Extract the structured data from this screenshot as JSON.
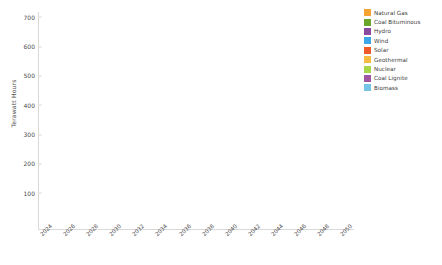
{
  "chart_data": {
    "type": "bar",
    "stacked": true,
    "title": "",
    "xlabel": "",
    "ylabel": "Terawatt Hours",
    "ylim": [
      0,
      740
    ],
    "yticks": [
      100,
      200,
      300,
      400,
      500,
      600,
      700
    ],
    "grid": false,
    "legend_position": "right",
    "categories": [
      "2024",
      "2025",
      "2026",
      "2027",
      "2028",
      "2029",
      "2030",
      "2031",
      "2032",
      "2033",
      "2034",
      "2035",
      "2036",
      "2037",
      "2038",
      "2039",
      "2040",
      "2041",
      "2042",
      "2043",
      "2044",
      "2045",
      "2046",
      "2047",
      "2048",
      "2049",
      "2050"
    ],
    "tick_labels": [
      "2024",
      "",
      "2026",
      "",
      "2028",
      "",
      "2030",
      "",
      "2032",
      "",
      "2034",
      "",
      "2036",
      "",
      "2038",
      "",
      "2040",
      "",
      "2042",
      "",
      "2044",
      "",
      "2046",
      "",
      "2048",
      "",
      "2050"
    ],
    "series": [
      {
        "name": "Biomass",
        "color": "#76c4e8",
        "values": [
          22,
          22,
          22,
          22,
          22,
          22,
          22,
          22,
          22,
          22,
          22,
          22,
          22,
          22,
          22,
          22,
          22,
          22,
          22,
          22,
          22,
          22,
          22,
          22,
          22,
          22,
          22
        ]
      },
      {
        "name": "Coal Lignite",
        "color": "#a055a0",
        "values": [
          38,
          38,
          38,
          38,
          38,
          38,
          38,
          38,
          38,
          38,
          38,
          38,
          38,
          38,
          38,
          38,
          38,
          38,
          38,
          38,
          38,
          38,
          38,
          38,
          38,
          38,
          38
        ]
      },
      {
        "name": "Nuclear",
        "color": "#a8d64a",
        "values": [
          4,
          4,
          4,
          4,
          4,
          4,
          4,
          4,
          4,
          4,
          4,
          4,
          4,
          4,
          4,
          4,
          4,
          4,
          4,
          4,
          4,
          4,
          4,
          4,
          4,
          4,
          4
        ]
      },
      {
        "name": "Geothermal",
        "color": "#f6bb43",
        "values": [
          4,
          4,
          4,
          4,
          4,
          4,
          4,
          4,
          4,
          4,
          4,
          4,
          4,
          4,
          4,
          4,
          4,
          4,
          4,
          4,
          4,
          4,
          4,
          4,
          4,
          4,
          4
        ]
      },
      {
        "name": "Solar",
        "color": "#ef5a2b",
        "values": [
          8,
          9,
          9,
          10,
          10,
          11,
          11,
          12,
          12,
          13,
          13,
          14,
          14,
          15,
          15,
          16,
          16,
          17,
          17,
          18,
          18,
          19,
          19,
          20,
          20,
          21,
          21
        ]
      },
      {
        "name": "Wind",
        "color": "#3ba7e8",
        "values": [
          32,
          36,
          40,
          44,
          48,
          52,
          56,
          60,
          64,
          68,
          72,
          76,
          80,
          84,
          88,
          92,
          96,
          100,
          104,
          108,
          112,
          116,
          118,
          120,
          122,
          124,
          126
        ]
      },
      {
        "name": "Hydro",
        "color": "#8a4b9e",
        "values": [
          190,
          195,
          200,
          205,
          210,
          215,
          220,
          226,
          232,
          238,
          244,
          250,
          256,
          262,
          268,
          274,
          280,
          286,
          290,
          294,
          296,
          298,
          300,
          300,
          300,
          300,
          300
        ]
      },
      {
        "name": "Coal Bituminous",
        "color": "#6aa62b",
        "values": [
          0,
          0,
          0,
          6,
          12,
          18,
          24,
          30,
          34,
          38,
          42,
          46,
          50,
          54,
          58,
          62,
          66,
          70,
          74,
          78,
          82,
          86,
          88,
          90,
          92,
          94,
          96
        ]
      },
      {
        "name": "Natural Gas",
        "color": "#f5a333",
        "values": [
          112,
          118,
          124,
          126,
          128,
          134,
          140,
          144,
          148,
          152,
          156,
          158,
          160,
          162,
          164,
          166,
          168,
          170,
          172,
          174,
          176,
          178,
          180,
          182,
          184,
          186,
          188
        ]
      }
    ]
  },
  "legend": {
    "items": [
      {
        "label": "Natural Gas",
        "color": "#f5a333"
      },
      {
        "label": "Coal Bituminous",
        "color": "#6aa62b"
      },
      {
        "label": "Hydro",
        "color": "#8a4b9e"
      },
      {
        "label": "Wind",
        "color": "#3ba7e8"
      },
      {
        "label": "Solar",
        "color": "#ef5a2b"
      },
      {
        "label": "Geothermal",
        "color": "#f6bb43"
      },
      {
        "label": "Nuclear",
        "color": "#a8d64a"
      },
      {
        "label": "Coal Lignite",
        "color": "#a055a0"
      },
      {
        "label": "Biomass",
        "color": "#76c4e8"
      }
    ]
  }
}
